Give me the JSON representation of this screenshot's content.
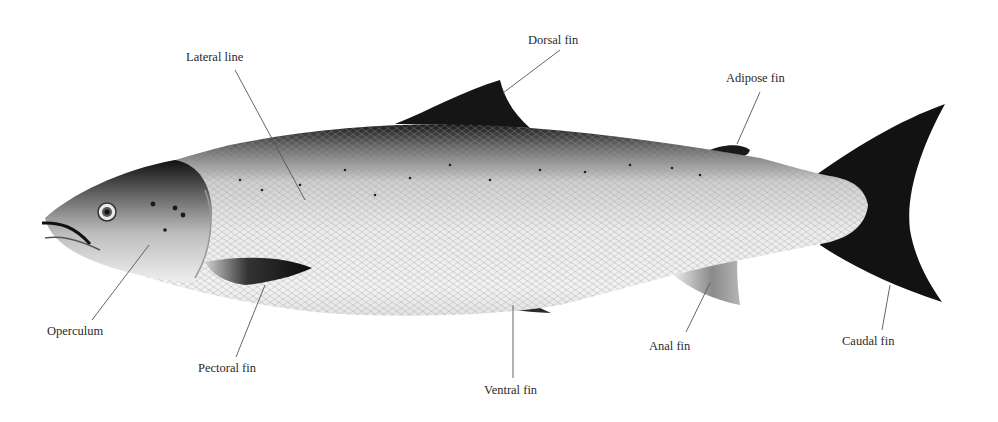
{
  "diagram": {
    "labels": [
      {
        "id": "lateral-line",
        "text": "Lateral line"
      },
      {
        "id": "dorsal-fin",
        "text": "Dorsal fin"
      },
      {
        "id": "adipose-fin",
        "text": "Adipose fin"
      },
      {
        "id": "operculum",
        "text": "Operculum"
      },
      {
        "id": "pectoral-fin",
        "text": "Pectoral fin"
      },
      {
        "id": "ventral-fin",
        "text": "Ventral fin"
      },
      {
        "id": "anal-fin",
        "text": "Anal fin"
      },
      {
        "id": "caudal-fin",
        "text": "Caudal fin"
      }
    ]
  },
  "colors": {
    "background": "#ffffff",
    "label_text": "#2a2a2a",
    "leader_line": "#555555",
    "fin_dark": "#111111",
    "body_light": "#e9e9e9"
  }
}
